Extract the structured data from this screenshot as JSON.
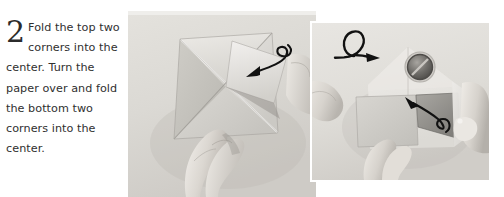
{
  "page": {
    "background_color": "#ffffff",
    "width": 504,
    "height": 197
  },
  "instruction": {
    "step_number": "2",
    "text": "Fold the top two corners into the center. Turn the paper over and fold the bottom two corners into the center.",
    "text_color": "#2f2f2f"
  },
  "photos": [
    {
      "id": "photo-main",
      "name": "origami-step-photo-main",
      "caption": "Hands folding a square sheet of paper with diagonal creases; a curved arrow indicates folding the top corner down toward the center.",
      "paper_color": "#d7d6d1",
      "background_color": "#dedcd7",
      "annotations": [
        "fold-arrow"
      ]
    },
    {
      "id": "photo-inset",
      "name": "origami-step-photo-inset",
      "caption": "Close-up of the paper turned over, showing a circular ring detail and a hand folding a bottom corner into the center.",
      "paper_color": "#dcdbd6",
      "background_color": "#e2e0db",
      "annotations": [
        "turn-over-symbol",
        "fold-arrow"
      ]
    }
  ],
  "annotations": {
    "fold_arrow_main": {
      "name": "fold-arrow",
      "direction": "down-left",
      "color": "#111111"
    },
    "turn_over_symbol": {
      "name": "turn-over-symbol",
      "description": "Loop with arrowhead meaning turn the paper over",
      "color": "#111111"
    },
    "fold_arrow_inset": {
      "name": "fold-arrow",
      "direction": "up-left",
      "color": "#111111"
    }
  }
}
